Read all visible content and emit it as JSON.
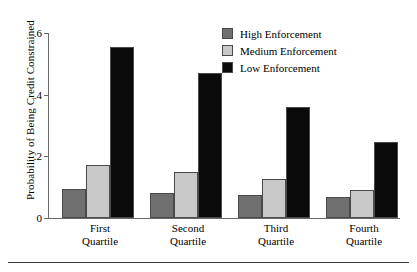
{
  "chart_data": {
    "type": "bar",
    "title": "",
    "xlabel": "",
    "ylabel": "Probability of Being Credit Constrained",
    "categories": [
      "First Quartile",
      "Second Quartile",
      "Third Quartile",
      "Fourth Quartile"
    ],
    "category_lines": [
      [
        "First",
        "Quartile"
      ],
      [
        "Second",
        "Quartile"
      ],
      [
        "Third",
        "Quartile"
      ],
      [
        "Fourth",
        "Quartile"
      ]
    ],
    "series": [
      {
        "name": "High Enforcement",
        "color": "#707070",
        "values": [
          0.094,
          0.081,
          0.074,
          0.068
        ]
      },
      {
        "name": "Medium Enforcement",
        "color": "#c8c8c8",
        "values": [
          0.171,
          0.148,
          0.126,
          0.09
        ]
      },
      {
        "name": "Low Enforcement",
        "color": "#0a0a0a",
        "values": [
          0.555,
          0.471,
          0.361,
          0.245
        ]
      }
    ],
    "ylim": [
      0,
      0.6
    ],
    "yticks": [
      0,
      0.2,
      0.4,
      0.6
    ],
    "ytick_labels": [
      "0",
      ".2",
      ".4",
      ".6"
    ],
    "grid": false,
    "legend_position": "top-right"
  },
  "legend": {
    "items": [
      {
        "label": "High Enforcement",
        "swatch": "#707070"
      },
      {
        "label": "Medium Enforcement",
        "swatch": "#c8c8c8"
      },
      {
        "label": "Low Enforcement",
        "swatch": "#0a0a0a"
      }
    ]
  }
}
